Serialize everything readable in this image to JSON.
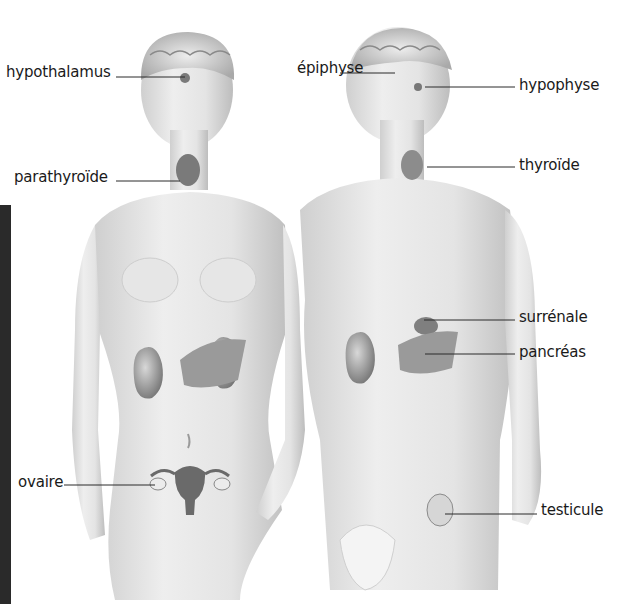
{
  "diagram": {
    "title": "",
    "type": "anatomical-endocrine-glands",
    "figures": [
      {
        "name": "female-figure"
      },
      {
        "name": "male-figure"
      }
    ],
    "labels": [
      {
        "id": "hypothalamus",
        "text": "hypothalamus",
        "x": 6,
        "y": 63,
        "line_from": [
          116,
          77
        ],
        "line_to": [
          185,
          77
        ]
      },
      {
        "id": "epiphyse",
        "text": "épiphyse",
        "x": 297,
        "y": 59,
        "line_from": [
          340,
          73
        ],
        "line_to": [
          395,
          73
        ]
      },
      {
        "id": "hypophyse",
        "text": "hypophyse",
        "x": 519,
        "y": 76,
        "line_from": [
          425,
          87
        ],
        "line_to": [
          515,
          87
        ]
      },
      {
        "id": "parathyroide",
        "text": "parathyroïde",
        "x": 14,
        "y": 168,
        "line_from": [
          116,
          181
        ],
        "line_to": [
          180,
          181
        ]
      },
      {
        "id": "thyroide",
        "text": "thyroïde",
        "x": 519,
        "y": 156,
        "line_from": [
          427,
          167
        ],
        "line_to": [
          515,
          167
        ]
      },
      {
        "id": "surrenale",
        "text": "surrénale",
        "x": 519,
        "y": 308,
        "line_from": [
          424,
          320
        ],
        "line_to": [
          515,
          320
        ]
      },
      {
        "id": "pancreas",
        "text": "pancréas",
        "x": 519,
        "y": 343,
        "line_from": [
          425,
          354
        ],
        "line_to": [
          515,
          354
        ]
      },
      {
        "id": "ovaire",
        "text": "ovaire",
        "x": 18,
        "y": 473,
        "line_from": [
          64,
          485
        ],
        "line_to": [
          155,
          485
        ]
      },
      {
        "id": "testicule",
        "text": "testicule",
        "x": 541,
        "y": 501,
        "line_from": [
          445,
          514
        ],
        "line_to": [
          537,
          514
        ]
      }
    ]
  }
}
